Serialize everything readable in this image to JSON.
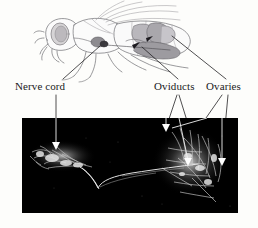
{
  "figure": {
    "background_color": "#fdfdfb",
    "panels": {
      "diagram": {
        "name": "fly-line-drawing",
        "description": "Lateral line drawing of an adult fly with shaded internal reproductive organs and nervous system"
      },
      "micrograph": {
        "name": "fluorescence-micrograph",
        "description": "Dark-field fluorescence image of dissected nerve cord, oviducts and ovaries with white arrowheads",
        "background_color": "#000000",
        "signal_color": "#e8e8e8"
      }
    }
  },
  "labels": [
    {
      "id": "nerve-cord",
      "text": "Nerve cord",
      "x": 15,
      "y": 80
    },
    {
      "id": "oviducts",
      "text": "Oviducts",
      "x": 154,
      "y": 80
    },
    {
      "id": "ovaries",
      "text": "Ovaries",
      "x": 206,
      "y": 80
    }
  ],
  "annotations": {
    "leader_line_color": "#2a2a2a",
    "arrow_color": "#ffffff",
    "pointer_targets": [
      {
        "label": "Nerve cord",
        "target": "thoracic ganglion"
      },
      {
        "label": "Oviducts",
        "target": "common and lateral oviduct"
      },
      {
        "label": "Ovaries",
        "target": "paired ovaries"
      }
    ]
  }
}
